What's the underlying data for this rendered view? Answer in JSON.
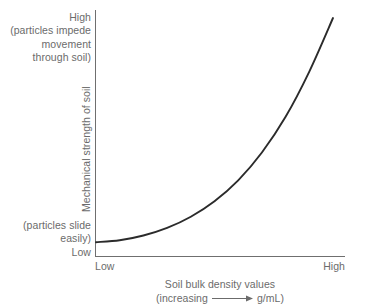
{
  "chart_data": {
    "type": "line",
    "title": "",
    "xlabel": "Soil bulk density values",
    "xlabel_sub_prefix": "(increasing",
    "xlabel_sub_suffix": "g/mL)",
    "ylabel": "Mechanical strength of soil",
    "x_tick_labels": [
      "Low",
      "High"
    ],
    "y_tick_labels": [
      "Low",
      "High"
    ],
    "y_high_annotation": [
      "High",
      "(particles impede",
      "movement",
      "through soil)"
    ],
    "y_low_annotation": [
      "(particles slide",
      "easily)",
      "Low"
    ],
    "x_arrow_icon": "right-arrow-icon",
    "grid": false,
    "legend": null,
    "xlim": [
      0,
      1
    ],
    "ylim": [
      0,
      1
    ],
    "series": [
      {
        "name": "mechanical strength vs bulk density",
        "description": "monotonically increasing convex (exponential-like) curve",
        "x": [
          0.0,
          0.1,
          0.2,
          0.3,
          0.4,
          0.5,
          0.6,
          0.7,
          0.8,
          0.9,
          1.0
        ],
        "y": [
          0.058,
          0.066,
          0.086,
          0.118,
          0.165,
          0.23,
          0.318,
          0.435,
          0.585,
          0.775,
          1.0
        ]
      }
    ],
    "colors": {
      "curve": "#2b2b2b",
      "axis": "#6f6f6f",
      "text": "#6b6b6b",
      "background": "#ffffff"
    }
  }
}
